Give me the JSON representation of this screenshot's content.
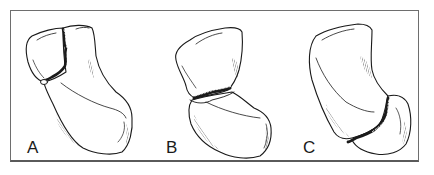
{
  "figure": {
    "panels": [
      {
        "label": "A",
        "fracture_location": "upper-left, near top of bone"
      },
      {
        "label": "B",
        "fracture_location": "middle, across the waist"
      },
      {
        "label": "C",
        "fracture_location": "lower-right, near bottom of bone"
      }
    ]
  },
  "colors": {
    "line": "#1a1a1a",
    "frame": "#6e6e6e",
    "background": "#ffffff"
  }
}
